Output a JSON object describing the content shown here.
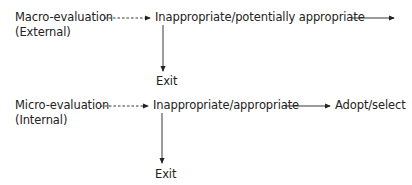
{
  "diagram": {
    "rows": [
      {
        "source_label": "Macro-evaluation",
        "source_sub": "(External)",
        "decision_label": "Inappropriate/potentially appropriate",
        "exit_label": "Exit",
        "next_label": ""
      },
      {
        "source_label": "Micro-evaluation",
        "source_sub": "(Internal)",
        "decision_label": "Inappropriate/appropriate",
        "exit_label": "Exit",
        "next_label": "Adopt/select"
      }
    ],
    "colors": {
      "text": "#222222",
      "line": "#222222",
      "background": "#ffffff"
    }
  }
}
